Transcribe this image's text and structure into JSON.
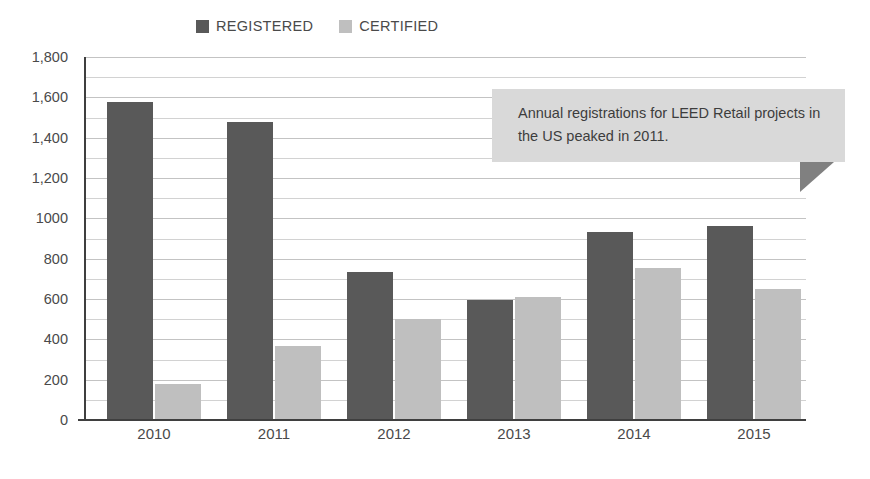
{
  "chart_data": {
    "type": "bar",
    "title": "",
    "subtitle": "",
    "xlabel": "",
    "ylabel": "",
    "categories": [
      "2010",
      "2011",
      "2012",
      "2013",
      "2014",
      "2015"
    ],
    "series": [
      {
        "name": "REGISTERED",
        "color": "#595959",
        "values": [
          1575,
          1480,
          735,
          595,
          930,
          960
        ]
      },
      {
        "name": "CERTIFIED",
        "color": "#bfbfbf",
        "values": [
          180,
          365,
          500,
          610,
          755,
          650
        ]
      }
    ],
    "ylim": [
      0,
      1800
    ],
    "ytick_values": [
      0,
      200,
      400,
      600,
      800,
      1000,
      1200,
      1400,
      1600,
      1800
    ],
    "ytick_labels": [
      "0",
      "200",
      "400",
      "600",
      "800",
      "1000",
      "1,200",
      "1,400",
      "1,600",
      "1,800"
    ],
    "grid": true,
    "gridline_interval": 100,
    "legend_position": "top-center",
    "annotations": [
      {
        "text": "Annual registrations for LEED Retail projects in the US peaked in 2011."
      }
    ]
  },
  "legend": {
    "items": [
      {
        "label": "REGISTERED",
        "color": "#595959"
      },
      {
        "label": "CERTIFIED",
        "color": "#bfbfbf"
      }
    ]
  },
  "callout": {
    "text": "Annual registrations for LEED Retail projects in the US peaked in 2011.",
    "background": "#d9d9d9",
    "tail_color": "#808080"
  },
  "colors": {
    "registered": "#595959",
    "certified": "#bfbfbf",
    "axis": "#3f3f3f",
    "gridline": "#d2d2d2",
    "text": "#4a4a4a",
    "background": "#ffffff"
  }
}
